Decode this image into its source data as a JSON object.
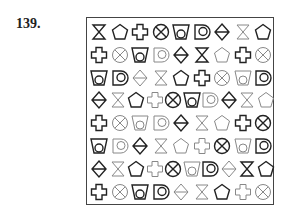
{
  "problem_number": "139.",
  "colors": {
    "dark": "#222222",
    "light": "#888888"
  },
  "grid": [
    [
      [
        "hourglass",
        "d"
      ],
      [
        "pentagon",
        "d"
      ],
      [
        "cross",
        "d"
      ],
      [
        "circlex",
        "d"
      ],
      [
        "cup",
        "d"
      ],
      [
        "dshape",
        "d"
      ],
      [
        "diamond",
        "d"
      ],
      [
        "hourglass",
        "l"
      ],
      [
        "pentagon",
        "d"
      ]
    ],
    [
      [
        "cross",
        "d"
      ],
      [
        "circlex",
        "l"
      ],
      [
        "cup",
        "d"
      ],
      [
        "dshape",
        "l"
      ],
      [
        "diamond",
        "d"
      ],
      [
        "hourglass",
        "d"
      ],
      [
        "pentagon",
        "l"
      ],
      [
        "cross",
        "d"
      ],
      [
        "circlex",
        "l"
      ]
    ],
    [
      [
        "cup",
        "d"
      ],
      [
        "dshape",
        "d"
      ],
      [
        "diamond",
        "l"
      ],
      [
        "hourglass",
        "l"
      ],
      [
        "pentagon",
        "d"
      ],
      [
        "cross",
        "d"
      ],
      [
        "circlex",
        "l"
      ],
      [
        "cup",
        "l"
      ],
      [
        "dshape",
        "d"
      ]
    ],
    [
      [
        "diamond",
        "d"
      ],
      [
        "hourglass",
        "l"
      ],
      [
        "pentagon",
        "d"
      ],
      [
        "cross",
        "l"
      ],
      [
        "circlex",
        "d"
      ],
      [
        "cup",
        "d"
      ],
      [
        "dshape",
        "l"
      ],
      [
        "diamond",
        "d"
      ],
      [
        "hourglass",
        "l"
      ],
      [
        "pentagon",
        "l"
      ]
    ],
    [
      [
        "cross",
        "d"
      ],
      [
        "circlex",
        "l"
      ],
      [
        "cup",
        "l"
      ],
      [
        "dshape",
        "l"
      ],
      [
        "diamond",
        "d"
      ],
      [
        "hourglass",
        "l"
      ],
      [
        "pentagon",
        "l"
      ],
      [
        "cross",
        "d"
      ],
      [
        "circlex",
        "d"
      ]
    ],
    [
      [
        "cup",
        "d"
      ],
      [
        "dshape",
        "l"
      ],
      [
        "diamond",
        "d"
      ],
      [
        "hourglass",
        "l"
      ],
      [
        "pentagon",
        "l"
      ],
      [
        "cross",
        "l"
      ],
      [
        "circlex",
        "d"
      ],
      [
        "cup",
        "l"
      ],
      [
        "dshape",
        "d"
      ]
    ],
    [
      [
        "diamond",
        "d"
      ],
      [
        "hourglass",
        "l"
      ],
      [
        "pentagon",
        "d"
      ],
      [
        "cross",
        "l"
      ],
      [
        "circlex",
        "d"
      ],
      [
        "cup",
        "l"
      ],
      [
        "dshape",
        "d"
      ],
      [
        "diamond",
        "l"
      ],
      [
        "hourglass",
        "d"
      ],
      [
        "pentagon",
        "d"
      ]
    ],
    [
      [
        "cross",
        "d"
      ],
      [
        "circlex",
        "l"
      ],
      [
        "cup",
        "d"
      ],
      [
        "dshape",
        "d"
      ],
      [
        "diamond",
        "l"
      ],
      [
        "hourglass",
        "l"
      ],
      [
        "pentagon",
        "d"
      ],
      [
        "cross",
        "l"
      ],
      [
        "circlex",
        "l"
      ]
    ]
  ]
}
